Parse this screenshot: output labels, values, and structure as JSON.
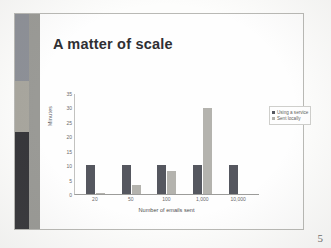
{
  "slide": {
    "title": "A matter of scale",
    "page_number": "5",
    "band": {
      "segment_top_color": "#8d9097",
      "segment_mid_color": "#a8a69e",
      "segment_bottom_color": "#36363a",
      "stripe_color": "#9a9a96"
    }
  },
  "chart_data": {
    "type": "bar",
    "title": "",
    "categories": [
      "20",
      "50",
      "100",
      "1,000",
      "10,000"
    ],
    "series": [
      {
        "name": "Using a service",
        "values": [
          10,
          10,
          10,
          10,
          10
        ],
        "color": "#55575f"
      },
      {
        "name": "Sent locally",
        "values": [
          0.5,
          3,
          8,
          30,
          0
        ],
        "color": "#b4b3ae"
      }
    ],
    "xlabel": "Number of emails sent",
    "ylabel": "Minutes",
    "ylim": [
      0,
      35
    ],
    "yticks": [
      "0",
      "5",
      "10",
      "15",
      "20",
      "25",
      "30",
      "35"
    ],
    "grid": false,
    "legend_position": "top-right"
  }
}
